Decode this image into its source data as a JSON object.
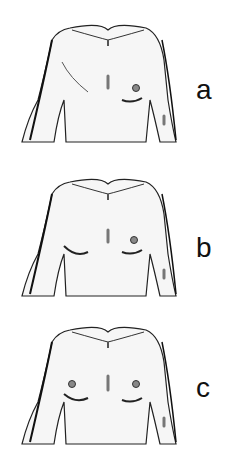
{
  "figure": {
    "panels": [
      {
        "label": "a",
        "description": "torso after right mastectomy with scar, left breast present"
      },
      {
        "label": "b",
        "description": "torso after right breast reconstruction, left nipple present"
      },
      {
        "label": "c",
        "description": "torso after reconstruction with both nipples"
      }
    ]
  }
}
